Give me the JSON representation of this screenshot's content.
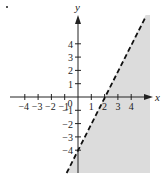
{
  "figure": {
    "bullet": "•"
  },
  "chart_data": {
    "type": "line",
    "title": "",
    "xlabel": "x",
    "ylabel": "y",
    "xlim": [
      -5,
      5.3
    ],
    "ylim": [
      -5.8,
      6
    ],
    "grid": false,
    "x_ticks": [
      -4,
      -3,
      -2,
      -1,
      0,
      1,
      2,
      3,
      4
    ],
    "x_tick_labels": [
      "−4",
      "−3",
      "−2",
      "−1",
      "0",
      "1",
      "2",
      "3",
      "4"
    ],
    "y_ticks": [
      4,
      3,
      2,
      1,
      -1,
      -2,
      -3,
      -4
    ],
    "y_tick_labels": [
      "4",
      "3",
      "2",
      "1",
      "−1",
      "−2",
      "−3",
      "−4"
    ],
    "series": [
      {
        "name": "boundary line y = 2x − 4",
        "style": "dashed",
        "slope": 2,
        "intercept": -4,
        "points": [
          {
            "x": 0,
            "y": -4
          },
          {
            "x": 2,
            "y": 0
          }
        ]
      }
    ],
    "shaded_region": {
      "description": "region right of / below the dashed line",
      "inequality": "y < 2x − 4",
      "fill_color": "#dcdcdc"
    },
    "colors": {
      "axis": "#222222",
      "line": "#111111",
      "shade": "#dcdcdc"
    }
  }
}
